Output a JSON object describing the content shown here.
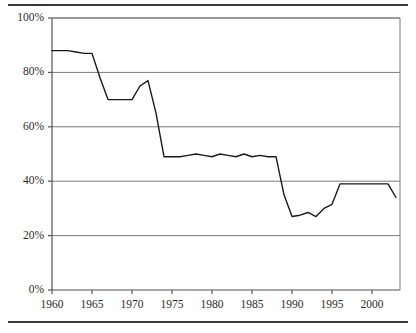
{
  "figure": {
    "background_color": "#ffffff",
    "rule_color": "#3a3a3a",
    "has_top_rule": true,
    "has_bottom_rule": true
  },
  "axes": {
    "plot_left_px": 52,
    "plot_right_px": 400,
    "plot_top_px": 18,
    "plot_bottom_px": 290,
    "axis_color": "#555555",
    "grid_color": "#7a7a7a",
    "line_color": "#1a1a1a",
    "line_width": 1.4
  },
  "chart_data": {
    "type": "line",
    "title": "",
    "subtitle": "",
    "xlabel": "",
    "ylabel": "",
    "xlim": [
      1960,
      2003.5
    ],
    "ylim": [
      0,
      100
    ],
    "grid": true,
    "grid_axis": "y",
    "legend": null,
    "legend_position": "none",
    "y_tick_labels": [
      "0%",
      "20%",
      "40%",
      "60%",
      "80%",
      "100%"
    ],
    "y_tick_values": [
      0,
      20,
      40,
      60,
      80,
      100
    ],
    "x_tick_labels": [
      "1960",
      "1965",
      "1970",
      "1975",
      "1980",
      "1985",
      "1990",
      "1995",
      "2000"
    ],
    "x_tick_values": [
      1960,
      1965,
      1970,
      1975,
      1980,
      1985,
      1990,
      1995,
      2000
    ],
    "x_minor_ticks": false,
    "series": [
      {
        "name": "series-1",
        "color": "#1a1a1a",
        "x": [
          1960,
          1961,
          1962,
          1963,
          1964,
          1965,
          1966,
          1967,
          1968,
          1969,
          1970,
          1971,
          1972,
          1973,
          1974,
          1975,
          1976,
          1977,
          1978,
          1979,
          1980,
          1981,
          1982,
          1983,
          1984,
          1985,
          1986,
          1987,
          1988,
          1989,
          1990,
          1991,
          1992,
          1993,
          1994,
          1995,
          1996,
          1997,
          1998,
          1999,
          2000,
          2001,
          2002,
          2003
        ],
        "values": [
          88,
          88,
          88,
          87.5,
          87,
          87,
          78,
          70,
          70,
          70,
          70,
          75,
          77,
          65,
          49,
          49,
          49,
          49.5,
          50,
          49.5,
          49,
          50,
          49.5,
          49,
          50,
          49,
          49.5,
          49,
          49,
          35,
          27,
          27.5,
          28.5,
          27,
          30,
          31.5,
          39,
          39,
          39,
          39,
          39,
          39,
          39,
          34
        ]
      }
    ]
  }
}
